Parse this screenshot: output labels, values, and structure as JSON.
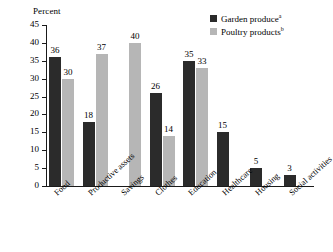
{
  "chart_data": {
    "type": "bar",
    "title": "",
    "xlabel": "",
    "ylabel": "Percent",
    "ylim": [
      0,
      45
    ],
    "ytick_step": 5,
    "yticks": [
      45,
      40,
      35,
      30,
      25,
      20,
      15,
      10,
      5,
      0
    ],
    "grid": false,
    "legend_position": "top-right",
    "categories": [
      "Food",
      "Productive assets",
      "Savings",
      "Clothes",
      "Education",
      "Healthcare",
      "Housing",
      "Social activities"
    ],
    "series": [
      {
        "name": "Garden produce",
        "note": "a",
        "color": "#2b2b2b",
        "values": [
          36,
          18,
          null,
          26,
          35,
          15,
          5,
          3
        ]
      },
      {
        "name": "Poultry products",
        "note": "b",
        "color": "#b6b6b6",
        "values": [
          30,
          37,
          40,
          14,
          33,
          null,
          null,
          null
        ]
      }
    ]
  },
  "legend": {
    "items": [
      {
        "label": "Garden produce",
        "note": "a",
        "swatch": "dark"
      },
      {
        "label": "Poultry products",
        "note": "b",
        "swatch": "light"
      }
    ]
  },
  "axis": {
    "y_title": "Percent"
  },
  "colors": {
    "series_dark": "#2b2b2b",
    "series_light": "#b6b6b6",
    "axis": "#1a1a1a",
    "background": "#ffffff"
  }
}
